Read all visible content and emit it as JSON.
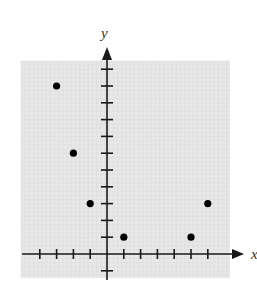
{
  "chart_data": {
    "type": "scatter",
    "title": "",
    "xlabel": "x",
    "ylabel": "y",
    "xlim": [
      -4,
      6
    ],
    "ylim": [
      -1,
      11
    ],
    "x_ticks": [
      -4,
      -3,
      -2,
      -1,
      1,
      2,
      3,
      4,
      5,
      6
    ],
    "y_ticks": [
      -1,
      1,
      2,
      3,
      4,
      5,
      6,
      7,
      8,
      9,
      10,
      11
    ],
    "tick_labels_shown": false,
    "grid": true,
    "legend": null,
    "series": [
      {
        "name": "points",
        "points": [
          {
            "x": -3,
            "y": 10
          },
          {
            "x": -2,
            "y": 6
          },
          {
            "x": -1,
            "y": 3
          },
          {
            "x": 1,
            "y": 1
          },
          {
            "x": 5,
            "y": 1
          },
          {
            "x": 6,
            "y": 3
          }
        ]
      }
    ]
  },
  "style": {
    "background": "#e8e8e8",
    "grid_line": "#d6d6d6",
    "axis_color": "#1a1a1a",
    "point_color": "#000000"
  },
  "labels": {
    "x_axis": "x",
    "y_axis": "y"
  }
}
